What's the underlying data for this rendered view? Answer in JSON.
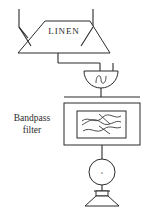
{
  "diagram": {
    "blocks": {
      "antenna": {
        "label": "LINEN",
        "shape": "trapezoid",
        "name": "linen-antenna"
      },
      "detector": {
        "label": "",
        "symbol": "sine-wave",
        "shape": "half-circle",
        "name": "oscillator-detector"
      },
      "filter": {
        "label_line1": "Bandpass",
        "label_line2": "filter",
        "shape": "rectangle",
        "symbol": "bandpass-response-curves",
        "name": "bandpass-filter"
      },
      "meter": {
        "label": "s",
        "shape": "circle",
        "name": "signal-meter"
      },
      "speaker": {
        "label": "",
        "shape": "horn",
        "name": "speaker-output"
      }
    },
    "colors": {
      "stroke": "#2b2b2b",
      "background": "#ffffff"
    }
  }
}
